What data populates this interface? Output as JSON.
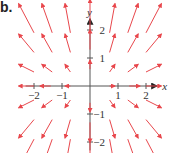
{
  "panel_label": "b.",
  "chart_data": {
    "type": "vector-field",
    "title": "",
    "xlabel": "x",
    "ylabel": "y",
    "xlim": [
      -2.3,
      2.4
    ],
    "ylim": [
      -2.3,
      2.4
    ],
    "x_ticks": [
      -2,
      -1,
      1,
      2
    ],
    "y_ticks": [
      -2,
      -1,
      1,
      2
    ],
    "x_tick_labels": [
      "−2",
      "−1",
      "1",
      "2"
    ],
    "y_tick_labels": [
      "−2",
      "−1",
      "1",
      "2"
    ],
    "field": "F(x, y) = (x/2, y)",
    "sample_x": [
      -2.0,
      -1.35,
      -0.7,
      0.7,
      1.35,
      2.0
    ],
    "sample_y": [
      -1.9,
      -1.2,
      -0.5,
      0.5,
      1.2,
      1.9
    ],
    "axis_sample_x": [
      -2.0,
      -1.4,
      -0.7,
      0.7,
      1.4,
      2.0
    ],
    "axis_sample_y": [
      -2.0,
      -1.3,
      -0.6,
      0.6,
      1.3,
      2.0
    ],
    "arrow_scale": 0.55,
    "arrow_color": "#e8474c",
    "axis_color": "#555555"
  }
}
